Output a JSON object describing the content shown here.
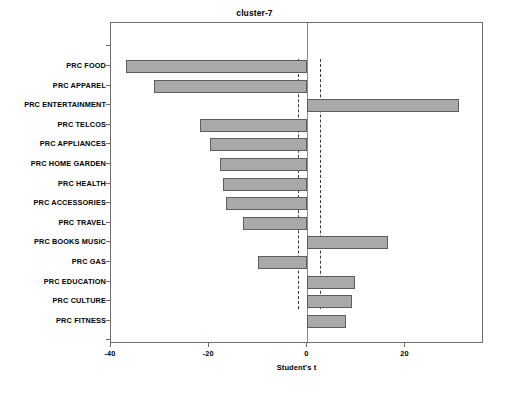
{
  "chart_data": {
    "type": "bar",
    "orientation": "horizontal",
    "title": "cluster-7",
    "xlabel": "Student's t",
    "ylabel": "",
    "xlim": [
      -40,
      36
    ],
    "xticks": [
      -40,
      -20,
      0,
      20
    ],
    "xticklabels": [
      "-40",
      "-20",
      "0",
      "20"
    ],
    "grid": false,
    "legend": null,
    "reference_lines": {
      "zero": 0,
      "significance_thresholds": [
        -1.96,
        2.6
      ]
    },
    "categories": [
      "PRC FOOD",
      "PRC APPAREL",
      "PRC ENTERTAINMENT",
      "PRC TELCOS",
      "PRC APPLIANCES",
      "PRC HOME GARDEN",
      "PRC HEALTH",
      "PRC ACCESSORIES",
      "PRC TRAVEL",
      "PRC BOOKS MUSIC",
      "PRC GAS",
      "PRC EDUCATION",
      "PRC CULTURE",
      "PRC FITNESS"
    ],
    "values": [
      -37.0,
      -31.2,
      31.0,
      -21.8,
      -19.8,
      -17.8,
      -17.1,
      -16.5,
      -13.1,
      16.5,
      -10.0,
      9.8,
      9.2,
      7.8
    ],
    "bar_color": "#a9a9a9",
    "bar_edge_color": "#5d5d5d"
  },
  "axis": {
    "x_title": "Student's t"
  }
}
